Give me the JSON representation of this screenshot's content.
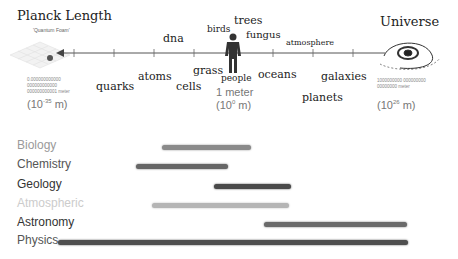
{
  "scale": {
    "left": {
      "title": "Planck Length",
      "subtitle": "'Quantum Foam'",
      "digits": "0.000000000000 000000000000 000000000001 meter",
      "exp_base": "(10",
      "exp_power": "-35",
      "exp_unit": " m)"
    },
    "center": {
      "title": "1 meter",
      "exp_base": "(10",
      "exp_power": "0",
      "exp_unit": " m)"
    },
    "right": {
      "title": "Universe",
      "digits": "1000000000 000000000 00000000 meter",
      "exp_base": "(10",
      "exp_power": "26",
      "exp_unit": " m)"
    },
    "words": [
      {
        "text": "quarks",
        "x": 96,
        "y": 80,
        "size": 11
      },
      {
        "text": "atoms",
        "x": 138,
        "y": 70,
        "size": 11
      },
      {
        "text": "dna",
        "x": 163,
        "y": 32,
        "size": 11
      },
      {
        "text": "cells",
        "x": 176,
        "y": 80,
        "size": 11
      },
      {
        "text": "grass",
        "x": 193,
        "y": 64,
        "size": 11
      },
      {
        "text": "birds",
        "x": 207,
        "y": 24,
        "size": 9
      },
      {
        "text": "trees",
        "x": 234,
        "y": 14,
        "size": 11
      },
      {
        "text": "fungus",
        "x": 246,
        "y": 29,
        "size": 10
      },
      {
        "text": "people",
        "x": 221,
        "y": 73,
        "size": 9
      },
      {
        "text": "oceans",
        "x": 258,
        "y": 68,
        "size": 11
      },
      {
        "text": "atmosphere",
        "x": 286,
        "y": 38,
        "size": 8
      },
      {
        "text": "galaxies",
        "x": 321,
        "y": 70,
        "size": 11
      },
      {
        "text": "planets",
        "x": 302,
        "y": 91,
        "size": 11
      }
    ]
  },
  "disciplines": [
    {
      "label": "Biology",
      "color": "#9a9a9a",
      "bar_start": 162,
      "bar_end": 251,
      "bar_color": "#8a8a8a"
    },
    {
      "label": "Chemistry",
      "color": "#555555",
      "bar_start": 136,
      "bar_end": 228,
      "bar_color": "#666666"
    },
    {
      "label": "Geology",
      "color": "#333333",
      "bar_start": 214,
      "bar_end": 291,
      "bar_color": "#4a4a4a"
    },
    {
      "label": "Atmospheric",
      "color": "#cccccc",
      "bar_start": 152,
      "bar_end": 289,
      "bar_color": "#b5b5b5"
    },
    {
      "label": "Astronomy",
      "color": "#333333",
      "bar_start": 264,
      "bar_end": 407,
      "bar_color": "#6a6a6a"
    },
    {
      "label": "Physics",
      "color": "#555555",
      "bar_start": 58,
      "bar_end": 408,
      "bar_color": "#4f4f4f"
    }
  ],
  "chart_data": {
    "type": "range-bar",
    "xlabel": "Size (meters, log scale)",
    "x_range_exponent": [
      -35,
      26
    ],
    "anchors": [
      {
        "label": "Planck Length",
        "value": "10^-35 m"
      },
      {
        "label": "1 meter",
        "value": "10^0 m"
      },
      {
        "label": "Universe",
        "value": "10^26 m"
      }
    ],
    "categories": [
      "Biology",
      "Chemistry",
      "Geology",
      "Atmospheric",
      "Astronomy",
      "Physics"
    ],
    "ranges_px": [
      [
        162,
        251
      ],
      [
        136,
        228
      ],
      [
        214,
        291
      ],
      [
        152,
        289
      ],
      [
        264,
        407
      ],
      [
        58,
        408
      ]
    ]
  }
}
